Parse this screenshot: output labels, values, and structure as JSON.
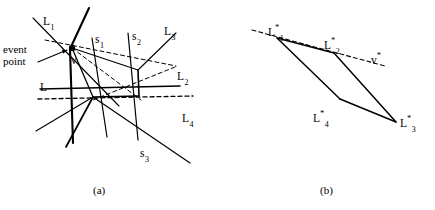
{
  "figure": {
    "panels": [
      {
        "id": "panel-a",
        "caption": "(a)",
        "caption_pos": [
          93,
          184
        ],
        "labels": [
          {
            "name": "label-L1",
            "text": "L",
            "sub": "1",
            "sup": "",
            "x": 43,
            "y": 15
          },
          {
            "name": "label-s1",
            "text": "s",
            "sub": "1",
            "sup": "",
            "x": 95,
            "y": 33
          },
          {
            "name": "label-s2",
            "text": "s",
            "sub": "2",
            "sup": "",
            "x": 132,
            "y": 30
          },
          {
            "name": "label-L3",
            "text": "L",
            "sub": "3",
            "sup": "",
            "x": 164,
            "y": 25
          },
          {
            "name": "label-L2",
            "text": "L",
            "sub": "2",
            "sup": "",
            "x": 177,
            "y": 70
          },
          {
            "name": "label-L",
            "text": "L",
            "sub": "",
            "sup": "",
            "x": 40,
            "y": 81
          },
          {
            "name": "label-L4",
            "text": "L",
            "sub": "4",
            "sup": "",
            "x": 182,
            "y": 112
          },
          {
            "name": "label-s3",
            "text": "s",
            "sub": "3",
            "sup": "",
            "x": 140,
            "y": 147
          },
          {
            "name": "label-vertex-v",
            "text": "v",
            "sub": "",
            "sup": "",
            "x": 71,
            "y": 54
          }
        ],
        "event_label": {
          "name": "label-event-point",
          "text": "event\npoint",
          "x": 3,
          "y": 44
        },
        "event_point": {
          "name": "event-point-dot",
          "cx": 72,
          "cy": 48,
          "r": 3.1
        },
        "arrow": {
          "name": "event-point-arrow",
          "x1": 38,
          "y1": 62,
          "x2": 67,
          "y2": 50
        },
        "solid_lines": [
          {
            "name": "line-L1",
            "x1": 33,
            "y1": 18,
            "x2": 119,
            "y2": 106,
            "w": 1.1
          },
          {
            "name": "line-steep-thick",
            "x1": 89,
            "y1": 8,
            "x2": 70,
            "y2": 49,
            "w": 2.1
          },
          {
            "name": "line-steep-thick-b",
            "x1": 70,
            "y1": 49,
            "x2": 73,
            "y2": 143,
            "w": 2.1
          },
          {
            "name": "line-s1",
            "x1": 92,
            "y1": 38,
            "x2": 107,
            "y2": 137,
            "w": 1.2
          },
          {
            "name": "line-s2",
            "x1": 128,
            "y1": 33,
            "x2": 138,
            "y2": 140,
            "w": 1.2
          },
          {
            "name": "line-L3",
            "x1": 176,
            "y1": 33,
            "x2": 138,
            "y2": 70,
            "w": 1.1
          },
          {
            "name": "line-L3-ext",
            "x1": 138,
            "y1": 70,
            "x2": 72,
            "y2": 48,
            "w": 1.1
          },
          {
            "name": "line-L-horizontal",
            "x1": 40,
            "y1": 89,
            "x2": 180,
            "y2": 86,
            "w": 1.5
          },
          {
            "name": "line-quad-right",
            "x1": 138,
            "y1": 70,
            "x2": 139,
            "y2": 96,
            "w": 1.6
          },
          {
            "name": "line-quad-bottom",
            "x1": 139,
            "y1": 96,
            "x2": 93,
            "y2": 97,
            "w": 1.6
          },
          {
            "name": "line-quad-left",
            "x1": 93,
            "y1": 97,
            "x2": 72,
            "y2": 48,
            "w": 1.3
          },
          {
            "name": "line-fan-a",
            "x1": 93,
            "y1": 97,
            "x2": 36,
            "y2": 131,
            "w": 1.1
          },
          {
            "name": "line-fan-b",
            "x1": 93,
            "y1": 97,
            "x2": 66,
            "y2": 147,
            "w": 1.7
          },
          {
            "name": "line-diag-lower",
            "x1": 93,
            "y1": 97,
            "x2": 190,
            "y2": 163,
            "w": 1.2
          }
        ],
        "dashed_lines": [
          {
            "name": "line-L2-dashed",
            "x1": 45,
            "y1": 40,
            "x2": 176,
            "y2": 66,
            "w": 1.0
          },
          {
            "name": "line-L4-dashed",
            "x1": 38,
            "y1": 99,
            "x2": 193,
            "y2": 96,
            "w": 1.3
          },
          {
            "name": "line-dash-diag-a",
            "x1": 72,
            "y1": 48,
            "x2": 141,
            "y2": 100,
            "w": 1.0
          },
          {
            "name": "line-dash-diag-b",
            "x1": 175,
            "y1": 67,
            "x2": 93,
            "y2": 100,
            "w": 1.0
          }
        ]
      },
      {
        "id": "panel-b",
        "caption": "(b)",
        "caption_pos": [
          320,
          184
        ],
        "labels": [
          {
            "name": "label-L1-star",
            "text": "L",
            "sub": "1",
            "sup": "*",
            "x": 268,
            "y": 24
          },
          {
            "name": "label-L2-star",
            "text": "L",
            "sub": "2",
            "sup": "*",
            "x": 324,
            "y": 37
          },
          {
            "name": "label-v-star",
            "text": "v",
            "sub": "",
            "sup": "*",
            "x": 371,
            "y": 52
          },
          {
            "name": "label-L4-star",
            "text": "L",
            "sub": "4",
            "sup": "*",
            "x": 313,
            "y": 110
          },
          {
            "name": "label-L3-star",
            "text": "L",
            "sub": "3",
            "sup": "*",
            "x": 400,
            "y": 115
          }
        ],
        "solid_lines": [
          {
            "name": "line-b-top",
            "x1": 277,
            "y1": 38,
            "x2": 334,
            "y2": 53,
            "w": 1.5
          },
          {
            "name": "line-b-right",
            "x1": 334,
            "y1": 53,
            "x2": 396,
            "y2": 122,
            "w": 1.5
          },
          {
            "name": "line-b-bottom",
            "x1": 396,
            "y1": 122,
            "x2": 340,
            "y2": 99,
            "w": 1.5
          },
          {
            "name": "line-b-left",
            "x1": 340,
            "y1": 99,
            "x2": 277,
            "y2": 38,
            "w": 1.5
          }
        ],
        "dashed_lines": [
          {
            "name": "line-vstar-dashed",
            "x1": 252,
            "y1": 30,
            "x2": 385,
            "y2": 66,
            "w": 1.1
          }
        ]
      }
    ],
    "style": {
      "stroke_color": "#000000",
      "background": "#ffffff",
      "dash_pattern": "4,3"
    }
  }
}
